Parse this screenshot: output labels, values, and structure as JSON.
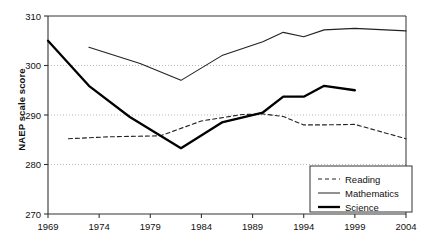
{
  "chart": {
    "title": "",
    "ylabel": "NAEP scale score",
    "xlabel": "",
    "legend": {
      "items": [
        {
          "label": "Reading",
          "style": "dashed",
          "width": 1,
          "color": "#222222"
        },
        {
          "label": "Mathematics",
          "style": "solid",
          "width": 1,
          "color": "#222222"
        },
        {
          "label": "Science",
          "style": "solid",
          "width": 2.3,
          "color": "#000000"
        }
      ]
    },
    "y_ticks": [
      "270",
      "280",
      "290",
      "300",
      "310"
    ],
    "x_ticks": [
      "1969",
      "1974",
      "1979",
      "1984",
      "1989",
      "1994",
      "1999",
      "2004"
    ]
  },
  "chart_data": {
    "type": "line",
    "title": "",
    "xlabel": "",
    "ylabel": "NAEP scale score",
    "xlim": [
      1969,
      2004
    ],
    "ylim": [
      270,
      310
    ],
    "yticks": [
      270,
      280,
      290,
      300,
      310
    ],
    "xticks": [
      1969,
      1974,
      1979,
      1984,
      1989,
      1994,
      1999,
      2004
    ],
    "grid": "horizontal-dotted",
    "legend_position": "bottom-right",
    "series": [
      {
        "name": "Reading",
        "style": "dashed",
        "x": [
          1971,
          1975,
          1980,
          1984,
          1988,
          1990,
          1992,
          1994,
          1996,
          1999,
          2004
        ],
        "y": [
          285.2,
          285.6,
          285.8,
          288.8,
          290.1,
          290.2,
          289.7,
          288.0,
          288.0,
          288.1,
          285.2
        ]
      },
      {
        "name": "Mathematics",
        "style": "solid",
        "x": [
          1973,
          1978,
          1982,
          1986,
          1990,
          1992,
          1994,
          1996,
          1999,
          2004
        ],
        "y": [
          303.7,
          300.4,
          297.0,
          302.0,
          304.8,
          306.7,
          305.8,
          307.2,
          307.5,
          307.0
        ]
      },
      {
        "name": "Science",
        "style": "solid-thick",
        "x": [
          1969,
          1973,
          1977,
          1982,
          1986,
          1990,
          1992,
          1994,
          1996,
          1999
        ],
        "y": [
          305.0,
          295.9,
          289.6,
          283.3,
          288.5,
          290.5,
          293.7,
          293.7,
          295.9,
          295.0
        ]
      }
    ]
  }
}
